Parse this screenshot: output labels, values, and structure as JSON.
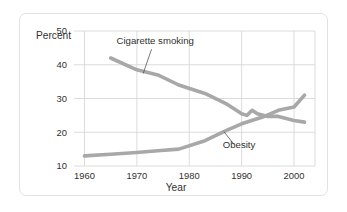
{
  "chart_data": {
    "type": "line",
    "title": "",
    "xlabel": "Year",
    "ylabel": "Percent",
    "xlim": [
      1958,
      2004
    ],
    "ylim": [
      10,
      50
    ],
    "xticks": [
      "1960",
      "1970",
      "1980",
      "1990",
      "2000"
    ],
    "yticks": [
      "10",
      "20",
      "30",
      "40",
      "50"
    ],
    "grid": true,
    "legend_position": "inline-annotation",
    "series": [
      {
        "name": "Cigarette smoking",
        "color": "#a8a8a8",
        "x": [
          1965,
          1970,
          1974,
          1978,
          1983,
          1987,
          1990,
          1991,
          1992,
          1993,
          1995,
          1997,
          2000,
          2002
        ],
        "values": [
          42.0,
          38.5,
          37.0,
          34.0,
          31.5,
          28.5,
          25.5,
          25.0,
          26.5,
          25.5,
          24.7,
          24.7,
          23.5,
          23.0
        ]
      },
      {
        "name": "Obesity",
        "color": "#a8a8a8",
        "x": [
          1960,
          1965,
          1970,
          1974,
          1978,
          1983,
          1987,
          1990,
          1994,
          1997,
          2000,
          2002
        ],
        "values": [
          13.0,
          13.5,
          14.0,
          14.5,
          15.0,
          17.5,
          20.5,
          22.5,
          24.5,
          26.5,
          27.5,
          31.0
        ]
      }
    ],
    "annotations": [
      {
        "text": "Cigarette smoking",
        "label_x": 1973.5,
        "label_y": 46.2,
        "leader_from": [
          1972.8,
          44.6
        ],
        "leader_to": [
          1971.2,
          37.4
        ]
      },
      {
        "text": "Obesity",
        "label_x": 1989.5,
        "label_y": 15.3,
        "leader_from": [
          1988.6,
          16.3
        ],
        "leader_to": [
          1986.6,
          20.2
        ]
      }
    ]
  },
  "figure": {
    "background_color": "#ffffff",
    "border_color": "#e2e2e2",
    "grid_color": "#d8d8d8",
    "text_color": "#33302e",
    "line_color": "#a8a8a8"
  }
}
